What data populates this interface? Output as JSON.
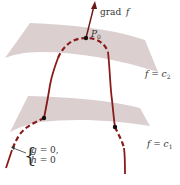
{
  "diagram": {
    "colors": {
      "surface_fill": "#d9cccd",
      "curve": "#8b1a1a",
      "point": "#111111",
      "text": "#333333",
      "arrow": "#6b1515"
    },
    "labels": {
      "grad_prefix": "grad",
      "grad_var": "f",
      "point_name": "P",
      "point_sub": "0",
      "upper_surface_lhs": "f",
      "upper_surface_eq": " = ",
      "upper_surface_rhs": "c",
      "upper_surface_sub": "2",
      "lower_surface_lhs": "f",
      "lower_surface_eq": " = ",
      "lower_surface_rhs": "c",
      "lower_surface_sub": "1",
      "constraint_line1_var": "g",
      "constraint_line1_rest": " = 0,",
      "constraint_line2_var": "h",
      "constraint_line2_rest": " = 0",
      "brace": "{"
    },
    "elements": [
      "upper level surface f = c2",
      "lower level surface f = c1",
      "constraint curve g = 0, h = 0",
      "gradient vector grad f at P0",
      "tangent point P0",
      "intersection points on lower surface"
    ]
  }
}
